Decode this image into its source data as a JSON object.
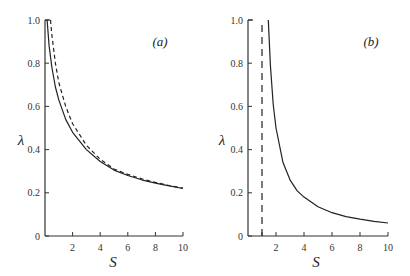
{
  "chart_data": [
    {
      "type": "line",
      "panel_label": "(a)",
      "xlabel": "S",
      "ylabel": "λ",
      "xlim": [
        0,
        10
      ],
      "ylim": [
        0,
        1.0
      ],
      "x_ticks": [
        "2",
        "4",
        "6",
        "8",
        "10"
      ],
      "y_ticks": [
        "0",
        "0.2",
        "0.4",
        "0.6",
        "0.8",
        "1.0"
      ],
      "grid": false,
      "series": [
        {
          "name": "solid",
          "style": "solid",
          "x": [
            0.15,
            0.3,
            0.5,
            0.75,
            1.0,
            1.5,
            2.0,
            3.0,
            4.0,
            5.0,
            6.0,
            7.0,
            8.0,
            9.0,
            10.0
          ],
          "y": [
            1.0,
            0.88,
            0.78,
            0.69,
            0.63,
            0.54,
            0.48,
            0.4,
            0.345,
            0.305,
            0.28,
            0.26,
            0.245,
            0.232,
            0.22
          ]
        },
        {
          "name": "dashed",
          "style": "dashed",
          "x": [
            0.4,
            0.5,
            0.75,
            1.0,
            1.5,
            2.0,
            3.0,
            4.0,
            5.0,
            6.0,
            7.0,
            8.0,
            9.0,
            10.0
          ],
          "y": [
            1.0,
            0.93,
            0.8,
            0.71,
            0.6,
            0.52,
            0.42,
            0.355,
            0.31,
            0.285,
            0.265,
            0.248,
            0.234,
            0.222
          ]
        }
      ]
    },
    {
      "type": "line",
      "panel_label": "(b)",
      "xlabel": "S",
      "ylabel": "λ",
      "xlim": [
        0,
        10
      ],
      "ylim": [
        0,
        1.0
      ],
      "x_ticks": [
        "2",
        "4",
        "6",
        "8",
        "10"
      ],
      "y_ticks": [
        "0",
        "0.2",
        "0.4",
        "0.6",
        "0.8",
        "1.0"
      ],
      "grid": false,
      "series": [
        {
          "name": "solid",
          "style": "solid",
          "x": [
            1.45,
            1.6,
            1.8,
            2.0,
            2.5,
            3.0,
            3.5,
            4.0,
            5.0,
            6.0,
            7.0,
            8.0,
            9.0,
            10.0
          ],
          "y": [
            1.0,
            0.79,
            0.61,
            0.5,
            0.34,
            0.26,
            0.21,
            0.18,
            0.135,
            0.108,
            0.09,
            0.078,
            0.068,
            0.06
          ]
        },
        {
          "name": "asymptote",
          "style": "dashed",
          "x": [
            1.0,
            1.0
          ],
          "y": [
            0,
            1.0
          ]
        }
      ]
    }
  ]
}
